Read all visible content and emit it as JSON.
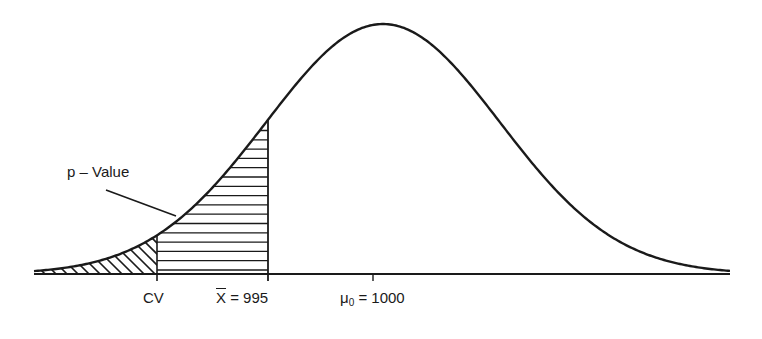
{
  "diagram": {
    "type": "normal-distribution-hypothesis-test",
    "colors": {
      "stroke": "#1a1a1a",
      "background": "#ffffff"
    },
    "curve": {
      "mean_px": 383,
      "sigma_px": 117,
      "baseline_y": 274,
      "peak_y": 24,
      "x_start": 34,
      "x_end": 730
    },
    "regions": [
      {
        "name": "critical-region",
        "fill": "diagonal-hatch",
        "from": "left-tail",
        "to": "CV"
      },
      {
        "name": "p-value-region",
        "fill": "horizontal-hatch",
        "from": "CV",
        "to": "X̄ = 995"
      }
    ],
    "labels": {
      "p_value": "p – Value",
      "cv": "CV",
      "xbar_symbol": "X",
      "xbar_value": " = 995",
      "mu_symbol": "μ",
      "mu_sub": "0",
      "mu_value": " = 1000"
    },
    "ticks": [
      {
        "label": "CV",
        "x": 157
      },
      {
        "label": "X̄ = 995",
        "x": 268
      },
      {
        "label": "μ0 = 1000",
        "x": 373
      }
    ]
  }
}
